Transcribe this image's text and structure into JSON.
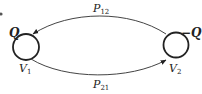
{
  "diagram": {
    "nodes": [
      {
        "id": "V1",
        "label_main": "V",
        "label_sub": "1",
        "charge": "Q"
      },
      {
        "id": "V2",
        "label_main": "V",
        "label_sub": "2",
        "charge": "−Q"
      }
    ],
    "edges": [
      {
        "from": "V2",
        "to": "V1",
        "label_main": "P",
        "label_sub": "12"
      },
      {
        "from": "V1",
        "to": "V2",
        "label_main": "P",
        "label_sub": "21"
      }
    ],
    "colors": {
      "stroke": "#222222",
      "background": "#ffffff"
    }
  }
}
